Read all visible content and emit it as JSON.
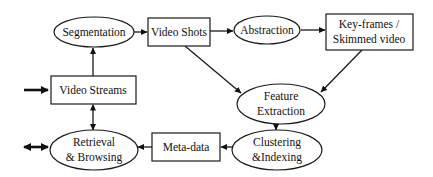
{
  "diagram": {
    "nodes": {
      "segmentation": {
        "label": "Segmentation",
        "shape": "ellipse"
      },
      "video_shots": {
        "label": "Video Shots",
        "shape": "rect"
      },
      "abstraction": {
        "label": "Abstraction",
        "shape": "ellipse"
      },
      "keyframes": {
        "line1": "Key-frames /",
        "line2": "Skimmed video",
        "shape": "rect"
      },
      "video_streams": {
        "label": "Video Streams",
        "shape": "rect"
      },
      "feature_extraction": {
        "line1": "Feature",
        "line2": "Extraction",
        "shape": "ellipse"
      },
      "retrieval": {
        "line1": "Retrieval",
        "line2": "& Browsing",
        "shape": "ellipse"
      },
      "meta_data": {
        "label": "Meta-data",
        "shape": "rect"
      },
      "clustering": {
        "line1": "Clustering",
        "line2": "&Indexing",
        "shape": "ellipse"
      }
    },
    "edges": [
      {
        "from": "input",
        "to": "video_streams",
        "style": "thick"
      },
      {
        "from": "video_streams",
        "to": "segmentation"
      },
      {
        "from": "segmentation",
        "to": "video_shots"
      },
      {
        "from": "video_shots",
        "to": "abstraction"
      },
      {
        "from": "abstraction",
        "to": "keyframes"
      },
      {
        "from": "video_shots",
        "to": "feature_extraction"
      },
      {
        "from": "keyframes",
        "to": "feature_extraction"
      },
      {
        "from": "feature_extraction",
        "to": "clustering"
      },
      {
        "from": "clustering",
        "to": "meta_data"
      },
      {
        "from": "meta_data",
        "to": "retrieval"
      },
      {
        "from": "video_streams",
        "to": "retrieval",
        "bidirectional": true
      },
      {
        "from": "retrieval",
        "to": "output",
        "bidirectional": true,
        "style": "thick"
      }
    ],
    "colors": {
      "stroke": "#1a1a1a",
      "fill": "#ffffff",
      "text": "#111111"
    }
  }
}
